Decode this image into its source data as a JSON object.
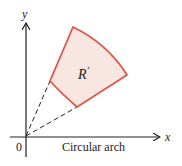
{
  "diagram": {
    "axis_labels": {
      "x": "x",
      "y": "y",
      "origin": "0"
    },
    "region_label": "R",
    "region_label_prime": "′",
    "caption": "Circular arch",
    "colors": {
      "region_fill": "#f8e6e0",
      "region_stroke": "#e0554a",
      "axes": "#222222",
      "dashed": "#222222"
    }
  }
}
